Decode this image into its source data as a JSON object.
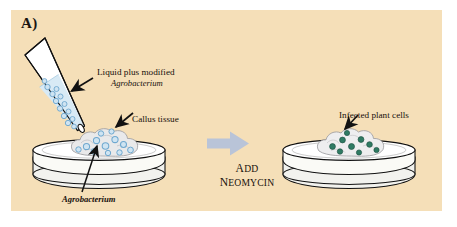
{
  "figure": {
    "panel_letter": "A)",
    "background_color": "#f5dfb8",
    "outer_background_color": "#ffffff",
    "width": 457,
    "height": 227,
    "title_text": "Agrobacterium-mediated plant cell transformation"
  },
  "labels": {
    "liquid_line1": "Liquid plus modified",
    "liquid_line2": "Agrobacterium",
    "callus": "Callus tissue",
    "agrobacterium_bottom": "Agrobacterium",
    "infected_cells": "Infected plant cells"
  },
  "process_arrow": {
    "caption_line1_first": "A",
    "caption_line1_rest": "DD",
    "caption_line2_first": "N",
    "caption_line2_rest": "EOMYCIN",
    "caption_line1_full": "ADD",
    "caption_line2_full": "NEOMYCIN",
    "arrow_color": "#b9c4d8",
    "arrow_icon": "arrow-right-block-icon"
  },
  "left_scene": {
    "name": "pipette-and-callus-scene",
    "pipette": {
      "icon": "pipette-icon",
      "body_color": "#ffffff",
      "liquid_color": "#d8eaf5",
      "outline_color": "#111111"
    },
    "bacteria": {
      "icon": "bacterium-circle-icon",
      "fill_color": "#cfe4f2",
      "stroke_color": "#6fa8cf",
      "count_in_stream": 13,
      "count_on_callus": 12
    },
    "callus": {
      "icon": "callus-tissue-icon",
      "fill_color": "#e9e9ea",
      "stroke_color": "#9a9a9d"
    },
    "petri_dish": {
      "icon": "petri-dish-icon",
      "fill_color": "#f2f2ee",
      "rim_color": "#ffffff",
      "stroke_color": "#111111"
    }
  },
  "right_scene": {
    "name": "infected-callus-scene",
    "callus": {
      "icon": "callus-tissue-icon",
      "fill_color": "#eeeeef",
      "stroke_color": "#9a9a9d"
    },
    "infected_cells": {
      "icon": "infected-cell-nucleus-icon",
      "nucleus_color": "#2f7b63",
      "cell_color": "#fbfbfb",
      "count": 9
    },
    "petri_dish": {
      "icon": "petri-dish-icon",
      "fill_color": "#f2f2ee",
      "rim_color": "#ffffff",
      "stroke_color": "#111111"
    }
  },
  "pointer_arrows": {
    "liquid_arrow": "arrow-pointer-icon",
    "callus_arrow": "arrow-pointer-icon",
    "agrobacterium_leader": "leader-line-icon",
    "infected_arrow": "arrow-pointer-icon"
  }
}
